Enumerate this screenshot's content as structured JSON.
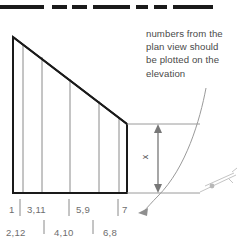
{
  "figure": {
    "type": "architectural-diagram",
    "rule": {
      "name": "top-dashed-rule",
      "segments": [
        {
          "x": 0,
          "width": 44
        },
        {
          "x": 52,
          "width": 15
        },
        {
          "x": 72,
          "width": 15
        },
        {
          "x": 93,
          "width": 37
        },
        {
          "x": 136,
          "width": 12
        },
        {
          "x": 154,
          "width": 13
        },
        {
          "x": 173,
          "width": 40
        }
      ],
      "y": 5,
      "thickness": 4,
      "color": "#1a1a1a"
    }
  },
  "annotation": {
    "text": "numbers from the\nplan view should\nbe plotted on the\nelevation",
    "lines": [
      "numbers from the",
      "plan view should",
      "be plotted on the",
      "elevation"
    ],
    "color": "#4a4a4a"
  },
  "elevation": {
    "apex": {
      "x": 13,
      "y": 37
    },
    "base_y": 193,
    "left_x": 13,
    "right_x": 127,
    "right_top_y": 124,
    "outline_color": "#1a1a1a",
    "division_color": "#8a8a8a",
    "divisions": [
      23,
      42,
      70,
      99,
      119
    ]
  },
  "dimension": {
    "label": "x",
    "arrow_x": 158,
    "top_y": 124,
    "bottom_y": 193,
    "extension_right_x": 200,
    "color": "#777777"
  },
  "callout_arrow": {
    "description": "curved leader from annotation down to bottom axis",
    "color": "#9a9a9a"
  },
  "labels": {
    "upper_row": [
      {
        "text": "1",
        "x": 9
      },
      {
        "text": "3,11",
        "x": 27
      },
      {
        "text": "5,9",
        "x": 76
      },
      {
        "text": "7",
        "x": 122
      }
    ],
    "lower_row": [
      {
        "text": "2,12",
        "x": 6
      },
      {
        "text": "4,10",
        "x": 54
      },
      {
        "text": "6,8",
        "x": 103
      }
    ],
    "tick_color": "#8a8a8a",
    "text_color": "#6e6e6e"
  },
  "corner_mark": {
    "description": "faint cropped diagonal marking at lower right edge",
    "color": "#c0c0c0"
  }
}
